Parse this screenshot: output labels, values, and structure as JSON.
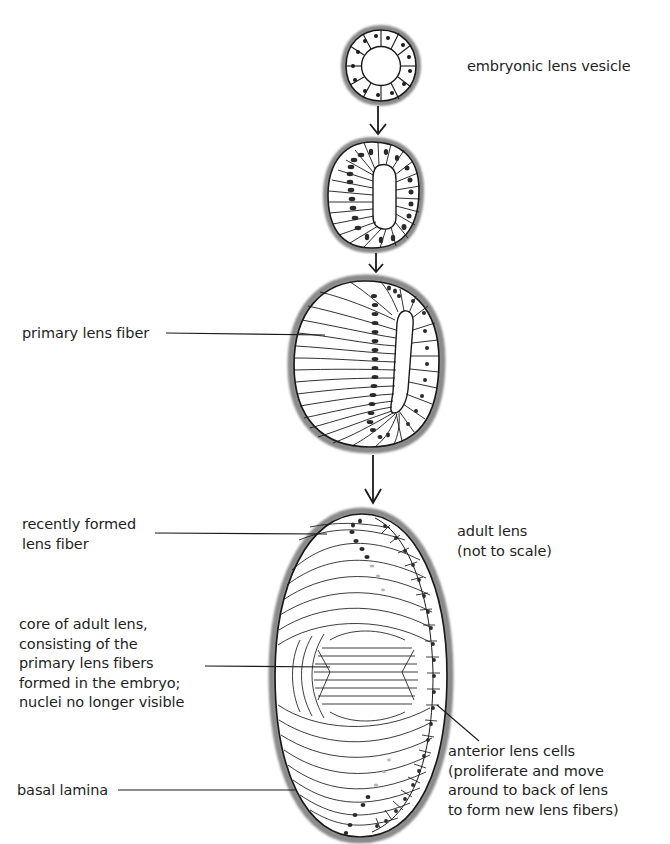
{
  "diagram": {
    "type": "developmental-sequence",
    "colors": {
      "outline": "#1a1a1a",
      "basal_lamina": "#8a8a8a",
      "nucleus": "#2a2a2a",
      "background": "#ffffff"
    },
    "stages": [
      {
        "id": "stage-1",
        "label": "embryonic lens vesicle"
      },
      {
        "id": "stage-2",
        "label": ""
      },
      {
        "id": "stage-3",
        "label": "primary lens fiber"
      },
      {
        "id": "stage-4",
        "label": "adult lens\n(not to scale)"
      }
    ],
    "labels": {
      "vesicle": "embryonic lens vesicle",
      "primary_fiber": "primary lens fiber",
      "recent_fiber": "recently formed\nlens fiber",
      "adult_lens": "adult lens\n(not to scale)",
      "core": "core of adult lens,\nconsisting of the\nprimary lens fibers\nformed in the embryo;\nnuclei no longer visible",
      "basal_lamina": "basal lamina",
      "anterior_cells": "anterior lens cells\n(proliferate and move\naround to back of lens\nto form new lens fibers)"
    },
    "arrows": [
      {
        "from": "stage-1",
        "to": "stage-2"
      },
      {
        "from": "stage-2",
        "to": "stage-3"
      },
      {
        "from": "stage-3",
        "to": "stage-4"
      }
    ]
  }
}
